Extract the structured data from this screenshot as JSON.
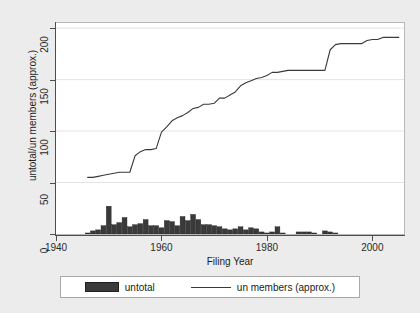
{
  "chart_data": {
    "type": "bar",
    "title": "",
    "xlabel": "Filing Year",
    "ylabel": "untotal/un members (approx.)",
    "xlim": [
      1940,
      2006
    ],
    "ylim": [
      0,
      205
    ],
    "xticks": [
      1940,
      1960,
      1980,
      2000
    ],
    "yticks": [
      0,
      50,
      100,
      150,
      200
    ],
    "grid": "horizontal",
    "legend_position": "below-plot",
    "series": [
      {
        "name": "untotal",
        "type": "bar",
        "color": "#3a3a3a",
        "x": [
          1946,
          1947,
          1948,
          1949,
          1950,
          1951,
          1952,
          1953,
          1954,
          1955,
          1956,
          1957,
          1958,
          1959,
          1960,
          1961,
          1962,
          1963,
          1964,
          1965,
          1966,
          1967,
          1968,
          1969,
          1970,
          1971,
          1972,
          1973,
          1974,
          1975,
          1976,
          1977,
          1978,
          1979,
          1980,
          1981,
          1982,
          1983,
          1984,
          1985,
          1986,
          1987,
          1988,
          1989,
          1990,
          1991,
          1992,
          1993,
          1994
        ],
        "values": [
          1,
          3,
          4,
          8,
          27,
          9,
          11,
          16,
          7,
          9,
          10,
          14,
          8,
          8,
          6,
          13,
          12,
          8,
          17,
          13,
          19,
          14,
          9,
          9,
          8,
          7,
          5,
          4,
          5,
          7,
          4,
          6,
          5,
          2,
          1,
          2,
          7,
          1,
          0,
          0,
          2,
          2,
          2,
          1,
          0,
          3,
          2,
          1,
          0
        ]
      },
      {
        "name": "un members (approx.)",
        "type": "line",
        "color": "#3a3a3a",
        "x": [
          1946,
          1947,
          1948,
          1949,
          1950,
          1951,
          1952,
          1953,
          1954,
          1955,
          1956,
          1957,
          1958,
          1959,
          1960,
          1961,
          1962,
          1963,
          1964,
          1965,
          1966,
          1967,
          1968,
          1969,
          1970,
          1971,
          1972,
          1973,
          1974,
          1975,
          1976,
          1977,
          1978,
          1979,
          1980,
          1981,
          1982,
          1983,
          1984,
          1985,
          1986,
          1987,
          1988,
          1989,
          1990,
          1991,
          1992,
          1993,
          1994,
          1995,
          1996,
          1997,
          1998,
          1999,
          2000,
          2001,
          2002,
          2003,
          2004,
          2005
        ],
        "values": [
          55,
          55,
          56,
          57,
          58,
          59,
          60,
          60,
          60,
          76,
          80,
          82,
          82,
          83,
          99,
          104,
          110,
          113,
          115,
          118,
          122,
          123,
          126,
          126,
          127,
          132,
          132,
          135,
          138,
          144,
          147,
          149,
          151,
          152,
          154,
          157,
          157,
          158,
          159,
          159,
          159,
          159,
          159,
          159,
          159,
          159,
          179,
          184,
          185,
          185,
          185,
          185,
          185,
          188,
          189,
          189,
          191,
          191,
          191,
          191
        ]
      }
    ]
  },
  "legend": {
    "bar_label": "untotal",
    "line_label": "un members (approx.)"
  }
}
